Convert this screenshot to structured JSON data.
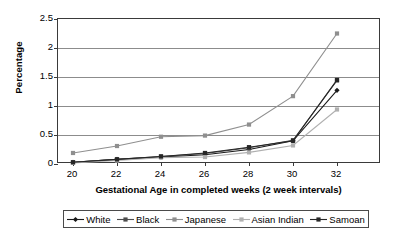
{
  "chart_data": {
    "type": "line",
    "title": "",
    "xlabel": "Gestational Age in completed weeks (2 week intervals)",
    "ylabel": "Percentage",
    "categories": [
      20,
      22,
      24,
      26,
      28,
      30,
      32
    ],
    "xtick_labels": [
      "20",
      "22",
      "24",
      "26",
      "28",
      "30",
      "32"
    ],
    "ytick_labels": [
      "0",
      "0.5",
      "1",
      "1.5",
      "2",
      "2.5"
    ],
    "ylim": [
      0,
      2.5
    ],
    "ytick_step": 0.5,
    "grid": "horizontal",
    "legend_position": "bottom",
    "series": [
      {
        "name": "White",
        "marker": "diamond",
        "color": "#1a1a1a",
        "values": [
          0.03,
          0.08,
          0.12,
          0.16,
          0.25,
          0.4,
          1.27
        ]
      },
      {
        "name": "Black",
        "marker": "square",
        "color": "#4d4d4d",
        "values": [
          0.03,
          0.08,
          0.13,
          0.18,
          0.28,
          0.41,
          1.44
        ]
      },
      {
        "name": "Japanese",
        "marker": "square",
        "color": "#8f8f8f",
        "values": [
          0.19,
          0.31,
          0.47,
          0.49,
          0.68,
          1.17,
          2.25
        ]
      },
      {
        "name": "Asian Indian",
        "marker": "square",
        "color": "#b0b0b0",
        "values": [
          0.02,
          0.06,
          0.11,
          0.12,
          0.2,
          0.32,
          0.94
        ]
      },
      {
        "name": "Samoan",
        "marker": "square",
        "color": "#262626",
        "values": [
          0.03,
          0.08,
          0.13,
          0.19,
          0.29,
          0.4,
          1.45
        ]
      }
    ]
  },
  "legend": {
    "items": [
      {
        "label": "White"
      },
      {
        "label": "Black"
      },
      {
        "label": "Japanese"
      },
      {
        "label": "Asian Indian"
      },
      {
        "label": "Samoan"
      }
    ]
  }
}
